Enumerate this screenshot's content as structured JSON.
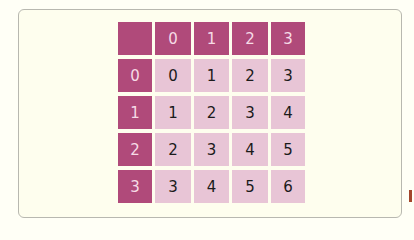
{
  "table": {
    "type": "addition-table",
    "corner": "",
    "column_headers": [
      "0",
      "1",
      "2",
      "3"
    ],
    "rows": [
      {
        "header": "0",
        "cells": [
          "0",
          "1",
          "2",
          "3"
        ]
      },
      {
        "header": "1",
        "cells": [
          "1",
          "2",
          "3",
          "4"
        ]
      },
      {
        "header": "2",
        "cells": [
          "2",
          "3",
          "4",
          "5"
        ]
      },
      {
        "header": "3",
        "cells": [
          "3",
          "4",
          "5",
          "6"
        ]
      }
    ]
  },
  "colors": {
    "header_bg": "#b04a7a",
    "header_text": "#f6dbe6",
    "cell_bg": "#e8c5d6",
    "cell_text": "#1b1b1b",
    "page_bg": "#fefeee"
  }
}
